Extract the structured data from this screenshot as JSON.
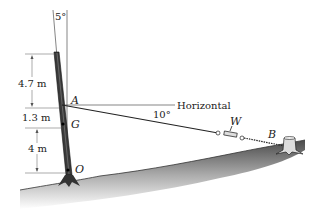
{
  "diagram": {
    "labels": {
      "angle_top": "5°",
      "dim_upper": "4.7 m",
      "dim_middle": "1.3 m",
      "dim_lower": "4 m",
      "point_A": "A",
      "point_G": "G",
      "point_O": "O",
      "point_B": "B",
      "weight": "W",
      "horizontal": "Horizontal",
      "angle_cable": "10°"
    },
    "colors": {
      "line": "#222222",
      "pole": "#444444",
      "ground_dark": "#555555",
      "ground_light": "#ffffff"
    }
  }
}
